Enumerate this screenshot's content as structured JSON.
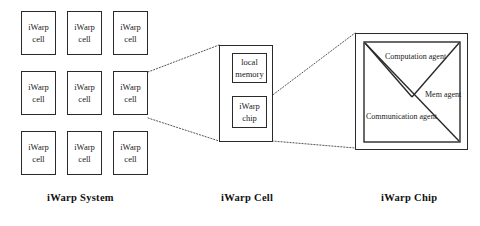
{
  "diagram": {
    "background_color": "#ffffff",
    "line_color": "#2a2a2a",
    "connector_style": "dotted"
  },
  "system": {
    "caption": "iWarp  System",
    "grid": {
      "rows": 3,
      "cols": 3,
      "cells": [
        {
          "line1": "iWarp",
          "line2": "cell"
        },
        {
          "line1": "iWarp",
          "line2": "cell"
        },
        {
          "line1": "iWarp",
          "line2": "cell"
        },
        {
          "line1": "iWarp",
          "line2": "cell"
        },
        {
          "line1": "iWarp",
          "line2": "cell"
        },
        {
          "line1": "iWarp",
          "line2": "cell"
        },
        {
          "line1": "iWarp",
          "line2": "cell"
        },
        {
          "line1": "iWarp",
          "line2": "cell"
        },
        {
          "line1": "iWarp",
          "line2": "cell"
        }
      ]
    }
  },
  "cell": {
    "caption": "iWarp Cell",
    "local_memory": {
      "line1": "local",
      "line2": "memory"
    },
    "chip": {
      "line1": "iWarp",
      "line2": "chip"
    }
  },
  "chip": {
    "caption": "iWarp Chip",
    "agents": [
      {
        "name": "computation-agent",
        "line1": "Computation",
        "line2": "agent"
      },
      {
        "name": "mem-agent",
        "line1": "Mem",
        "line2": "agent"
      },
      {
        "name": "communication-agent",
        "line1": "Communication",
        "line2": "agent"
      }
    ]
  }
}
